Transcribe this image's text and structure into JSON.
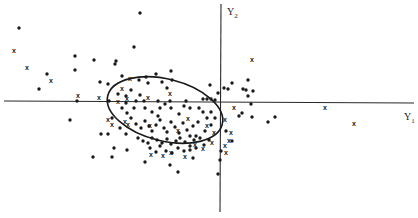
{
  "chart_data": {
    "type": "scatter",
    "title": "",
    "xlabel": "Y",
    "xlabel_sub": "1",
    "ylabel": "Y",
    "ylabel_sub": "2",
    "grid": false,
    "legend": null,
    "axes": {
      "origin_px": [
        221,
        101
      ],
      "x_axis_px": [
        4,
        414
      ],
      "y_axis_px": [
        4,
        212
      ]
    },
    "ellipse": {
      "cx": 165,
      "cy": 110,
      "rx": 59,
      "ry": 31,
      "rotation_deg": 14
    },
    "series": [
      {
        "name": "dots",
        "marker": "dot",
        "color": "#1a1a1a",
        "points": [
          [
            19,
            28
          ],
          [
            47,
            74
          ],
          [
            39,
            89
          ],
          [
            75,
            56
          ],
          [
            75,
            70
          ],
          [
            94,
            60
          ],
          [
            100,
            82
          ],
          [
            115,
            64
          ],
          [
            116,
            61
          ],
          [
            134,
            47
          ],
          [
            140,
            13
          ],
          [
            122,
            76
          ],
          [
            118,
            94
          ],
          [
            108,
            84
          ],
          [
            70,
            120
          ],
          [
            77,
            101
          ],
          [
            109,
            101
          ],
          [
            101,
            134
          ],
          [
            108,
            134
          ],
          [
            93,
            157
          ],
          [
            112,
            157
          ],
          [
            112,
            118
          ],
          [
            122,
            108
          ],
          [
            127,
            113
          ],
          [
            131,
            90
          ],
          [
            139,
            80
          ],
          [
            146,
            77
          ],
          [
            156,
            74
          ],
          [
            162,
            82
          ],
          [
            167,
            88
          ],
          [
            172,
            80
          ],
          [
            171,
            71
          ],
          [
            148,
            83
          ],
          [
            140,
            95
          ],
          [
            126,
            96
          ],
          [
            136,
            101
          ],
          [
            144,
            101
          ],
          [
            158,
            101
          ],
          [
            170,
            101
          ],
          [
            186,
            101
          ],
          [
            203,
            99
          ],
          [
            207,
            99
          ],
          [
            211,
            99
          ],
          [
            215,
            100
          ],
          [
            126,
            103
          ],
          [
            134,
            108
          ],
          [
            145,
            108
          ],
          [
            152,
            112
          ],
          [
            158,
            116
          ],
          [
            160,
            108
          ],
          [
            165,
            104
          ],
          [
            171,
            108
          ],
          [
            179,
            114
          ],
          [
            184,
            106
          ],
          [
            190,
            108
          ],
          [
            199,
            108
          ],
          [
            203,
            112
          ],
          [
            207,
            118
          ],
          [
            211,
            112
          ],
          [
            215,
            118
          ],
          [
            211,
            125
          ],
          [
            205,
            131
          ],
          [
            196,
            136
          ],
          [
            131,
            118
          ],
          [
            136,
            124
          ],
          [
            141,
            128
          ],
          [
            145,
            121
          ],
          [
            149,
            126
          ],
          [
            152,
            131
          ],
          [
            156,
            125
          ],
          [
            160,
            120
          ],
          [
            164,
            128
          ],
          [
            167,
            132
          ],
          [
            171,
            122
          ],
          [
            175,
            127
          ],
          [
            179,
            133
          ],
          [
            183,
            123
          ],
          [
            187,
            130
          ],
          [
            190,
            136
          ],
          [
            193,
            126
          ],
          [
            198,
            122
          ],
          [
            138,
            138
          ],
          [
            143,
            141
          ],
          [
            148,
            143
          ],
          [
            152,
            138
          ],
          [
            157,
            140
          ],
          [
            162,
            143
          ],
          [
            167,
            139
          ],
          [
            171,
            144
          ],
          [
            176,
            141
          ],
          [
            180,
            138
          ],
          [
            185,
            142
          ],
          [
            190,
            146
          ],
          [
            194,
            140
          ],
          [
            200,
            138
          ],
          [
            204,
            145
          ],
          [
            209,
            140
          ],
          [
            150,
            148
          ],
          [
            156,
            152
          ],
          [
            160,
            146
          ],
          [
            166,
            151
          ],
          [
            172,
            153
          ],
          [
            178,
            148
          ],
          [
            184,
            151
          ],
          [
            190,
            150
          ],
          [
            196,
            148
          ],
          [
            120,
            128
          ],
          [
            126,
            134
          ],
          [
            114,
            148
          ],
          [
            127,
            150
          ],
          [
            145,
            162
          ],
          [
            170,
            165
          ],
          [
            193,
            158
          ],
          [
            178,
            172
          ],
          [
            210,
            85
          ],
          [
            218,
            93
          ],
          [
            224,
            88
          ],
          [
            232,
            83
          ],
          [
            243,
            89
          ],
          [
            248,
            80
          ],
          [
            246,
            90
          ],
          [
            253,
            91
          ],
          [
            248,
            96
          ],
          [
            251,
            104
          ],
          [
            252,
            117
          ],
          [
            228,
            89
          ],
          [
            242,
            113
          ],
          [
            239,
            116
          ],
          [
            268,
            122
          ],
          [
            275,
            117
          ],
          [
            221,
            151
          ],
          [
            220,
            160
          ],
          [
            218,
            174
          ],
          [
            226,
            131
          ],
          [
            232,
            141
          ]
        ]
      },
      {
        "name": "crosses",
        "marker": "x",
        "color": "#1a1a1a",
        "points": [
          [
            14,
            50
          ],
          [
            27,
            67
          ],
          [
            51,
            80
          ],
          [
            78,
            95
          ],
          [
            99,
            97
          ],
          [
            122,
            88
          ],
          [
            130,
            78
          ],
          [
            118,
            101
          ],
          [
            127,
            98
          ],
          [
            148,
            97
          ],
          [
            170,
            93
          ],
          [
            125,
            121
          ],
          [
            128,
            124
          ],
          [
            108,
            119
          ],
          [
            112,
            124
          ],
          [
            150,
            125
          ],
          [
            178,
            130
          ],
          [
            188,
            118
          ],
          [
            207,
            125
          ],
          [
            214,
            132
          ],
          [
            195,
            144
          ],
          [
            171,
            152
          ],
          [
            163,
            155
          ],
          [
            151,
            154
          ],
          [
            185,
            156
          ],
          [
            203,
            148
          ],
          [
            212,
            142
          ],
          [
            231,
            132
          ],
          [
            229,
            140
          ],
          [
            225,
            145
          ],
          [
            226,
            152
          ],
          [
            234,
            107
          ],
          [
            252,
            59
          ],
          [
            225,
            119
          ],
          [
            325,
            107
          ],
          [
            354,
            123
          ]
        ]
      }
    ]
  }
}
